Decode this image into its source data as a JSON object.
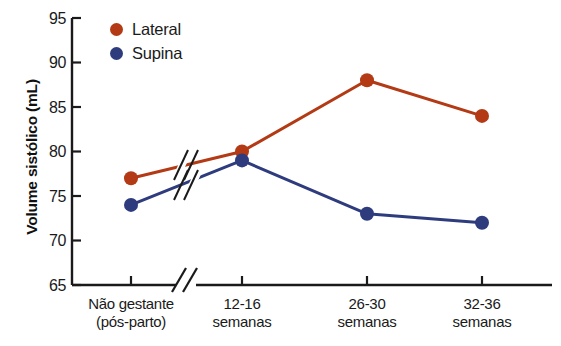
{
  "chart_data": {
    "type": "line",
    "title": "",
    "xlabel": "",
    "ylabel": "Volume sistólico (mL)",
    "categories": [
      "Não gestante\n(pós-parto)",
      "12-16\nsemanas",
      "26-30\nsemanas",
      "32-36\nsemanas"
    ],
    "category_lines": [
      [
        "Não gestante",
        "(pós-parto)"
      ],
      [
        "12-16",
        "semanas"
      ],
      [
        "26-30",
        "semanas"
      ],
      [
        "32-36",
        "semanas"
      ]
    ],
    "series": [
      {
        "name": "Lateral",
        "color": "#B33A15",
        "values": [
          77,
          80,
          88,
          84
        ]
      },
      {
        "name": "Supina",
        "color": "#2E3C7E",
        "values": [
          74,
          79,
          73,
          72
        ]
      }
    ],
    "ylim": [
      65,
      95
    ],
    "yticks": [
      65,
      70,
      75,
      80,
      85,
      90,
      95
    ],
    "ytick_labels": [
      "65",
      "70",
      "75",
      "80",
      "85",
      "90",
      "95"
    ],
    "grid": false,
    "legend_position": "top-left",
    "axis_break": {
      "present": true,
      "between_categories": [
        0,
        1
      ],
      "note": "double-slash break on x-axis and on both data lines"
    }
  },
  "legend": {
    "items": [
      {
        "label": "Lateral",
        "color": "#B33A15"
      },
      {
        "label": "Supina",
        "color": "#2E3C7E"
      }
    ]
  },
  "axes": {
    "y_title": "Volume sistólico (mL)",
    "y_ticks": [
      "95",
      "90",
      "85",
      "80",
      "75",
      "70",
      "65"
    ],
    "x_ticks": [
      {
        "line1": "Não gestante",
        "line2": "(pós-parto)"
      },
      {
        "line1": "12-16",
        "line2": "semanas"
      },
      {
        "line1": "26-30",
        "line2": "semanas"
      },
      {
        "line1": "32-36",
        "line2": "semanas"
      }
    ]
  },
  "colors": {
    "lateral": "#B33A15",
    "supina": "#2E3C7E",
    "axis": "#1a1a1a",
    "background": "#ffffff"
  }
}
